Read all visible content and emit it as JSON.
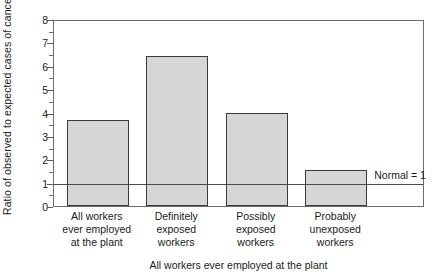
{
  "chart_data": {
    "type": "bar",
    "title": "",
    "subtitle": "",
    "xlabel": "All workers ever employed at the plant",
    "ylabel": "Ratio of observed to expected cases of cancer",
    "categories": [
      "All workers\never employed\nat the plant",
      "Definitely\nexposed\nworkers",
      "Possibly\nexposed\nworkers",
      "Probably\nunexposed\nworkers"
    ],
    "values": [
      3.68,
      6.42,
      3.97,
      1.55
    ],
    "ylim": [
      0,
      8
    ],
    "ytick_labels": [
      "0",
      "1",
      "2",
      "3",
      "4",
      "5",
      "6",
      "7",
      "8"
    ],
    "ytick_values": [
      0,
      1,
      2,
      3,
      4,
      5,
      6,
      7,
      8
    ],
    "yminor_values": [
      0.5,
      1.5,
      2.5,
      3.5,
      4.5,
      5.5,
      6.5,
      7.5
    ],
    "grid": false,
    "legend_position": "none",
    "annotations": [
      {
        "text": "Normal = 1",
        "y": 1,
        "type": "reference-line-label"
      }
    ],
    "reference_line": {
      "value": 1,
      "label": "Normal = 1"
    },
    "colors": {
      "bar_fill": "#d6d6d6",
      "bar_edge": "#3b3b3b",
      "axis": "#6b6b6b",
      "reference_line": "#4a4a4a",
      "text": "#1a1a1a",
      "background": "#ffffff"
    }
  }
}
